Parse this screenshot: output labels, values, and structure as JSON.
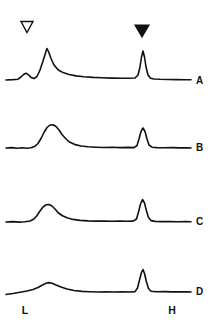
{
  "figure": {
    "background_color": "#ffffff",
    "line_color": "#111111",
    "width": 218,
    "height": 330
  },
  "markers": [
    {
      "name": "open-triangle-marker",
      "style": "open-down-triangle",
      "x": 27,
      "y": 27,
      "annotates": "L",
      "label": ""
    },
    {
      "name": "filled-triangle-marker",
      "style": "filled-down-triangle",
      "x": 142,
      "y": 31,
      "annotates": "H",
      "label": ""
    }
  ],
  "axis": {
    "left_label": "L",
    "left_label_x": 25,
    "left_label_y": 314,
    "right_label": "H",
    "right_label_x": 172,
    "right_label_y": 314
  },
  "traces": [
    {
      "label": "A",
      "label_x": 196,
      "label_y": 84,
      "baseline_y": 80,
      "path": "M 6 80 L 13 79.6 L 18 79.2 L 21 77 L 23.5 74.5 L 26 73.2 L 28.5 74.8 L 31 77.4 L 34 78.6 L 37 76.5 L 40 70 L 43 61 L 45.5 53 L 47 48.5 L 48.5 51.5 L 51 58.5 L 54 65 L 58 69.8 L 63 72.6 L 69 74.5 L 76 75.9 L 84 76.8 L 93 77.4 L 102 77.8 L 112 78.1 L 122 78.3 L 130 78.3 L 135 78 L 138 75 L 140 67 L 141.5 57 L 143 51 L 144.5 57 L 146 67 L 148 75 L 150.5 78.2 L 154 79 L 160 79.3 L 168 79.5 L 176 79.6 L 186 79.7 L 191 79.8"
    },
    {
      "label": "B",
      "label_x": 196,
      "label_y": 151,
      "baseline_y": 148,
      "path": "M 6 148 L 12 147.6 L 17 148.2 L 22 147.7 L 27 148.3 L 31 147.8 L 35 146.2 L 38 143.5 L 41 138.5 L 44 132.5 L 47 127.5 L 50 125 L 53 124.8 L 56 126.5 L 59 130 L 62 134.5 L 66 139 L 70 142.3 L 75 144.6 L 81 146 L 88 146.8 L 96 147.2 L 104 147.5 L 112 147.3 L 120 147.6 L 128 147.4 L 134 147.6 L 137 145.5 L 139 139 L 141 131.5 L 143 128 L 145 131.5 L 147 139 L 149 145 L 152 147.2 L 157 147.6 L 164 147.8 L 172 147.6 L 180 147.9 L 188 147.7 L 191 148"
    },
    {
      "label": "C",
      "label_x": 196,
      "label_y": 225,
      "baseline_y": 222,
      "path": "M 6 222 L 13 221.6 L 19 222.1 L 25 221.7 L 30 221 L 34 219 L 37 215.5 L 40 211 L 43 207 L 46 204.8 L 49 204.5 L 52 206 L 55 209 L 58 212.5 L 62 215.5 L 67 217.8 L 73 219.4 L 80 220.4 L 88 220.9 L 96 221.1 L 104 221 L 112 221.3 L 120 221 L 127 221.3 L 133 221.1 L 136.5 219 L 138.5 212 L 140.5 204 L 142.5 199.5 L 144.5 203 L 146.5 211 L 148.5 217.5 L 151 220.6 L 155 221.4 L 162 221.6 L 170 221.5 L 178 221.7 L 186 221.6 L 191 221.8"
    },
    {
      "label": "D",
      "label_x": 196,
      "label_y": 295,
      "baseline_y": 292,
      "path": "M 6 294.5 L 13 293.5 L 20 292.3 L 27 291 L 33 289.5 L 38 287.5 L 42 285.2 L 46 283.2 L 49 282.6 L 52 283.2 L 56 284.9 L 61 287 L 67 289 L 74 290.5 L 82 291.4 L 90 291.7 L 98 292 L 106 291.7 L 114 292 L 122 291.8 L 130 292 L 135 291.6 L 137.5 288 L 139.5 280 L 141.5 272.5 L 143 269.5 L 144.5 273.5 L 146.5 282 L 148.5 288.5 L 151 291.2 L 156 291.8 L 164 291.6 L 172 291.9 L 180 291.7 L 188 291.9 L 191 292"
    }
  ],
  "chart_data": {
    "type": "line",
    "xlabel": "",
    "ylabel": "",
    "grid": false,
    "legend": "none",
    "x_axis_markers": [
      "L",
      "H"
    ],
    "x_marker_positions": [
      25,
      172
    ],
    "annotations": [
      {
        "symbol": "open down triangle",
        "x": 27,
        "y": 27,
        "refers_to": "L peak"
      },
      {
        "symbol": "filled down triangle",
        "x": 142,
        "y": 31,
        "refers_to": "H peak"
      }
    ],
    "series": [
      {
        "name": "A",
        "baseline_y": 80,
        "peaks": [
          {
            "name": "shoulder",
            "x": 24,
            "height_rel": 0.18
          },
          {
            "name": "L",
            "x": 47,
            "height_rel": 1.0
          },
          {
            "name": "H",
            "x": 143,
            "height_rel": 0.88
          }
        ]
      },
      {
        "name": "B",
        "baseline_y": 148,
        "peaks": [
          {
            "name": "L",
            "x": 51,
            "height_rel": 0.74
          },
          {
            "name": "H",
            "x": 143,
            "height_rel": 0.64
          }
        ]
      },
      {
        "name": "C",
        "baseline_y": 222,
        "peaks": [
          {
            "name": "L",
            "x": 48,
            "height_rel": 0.56
          },
          {
            "name": "H",
            "x": 143,
            "height_rel": 0.72
          }
        ]
      },
      {
        "name": "D",
        "baseline_y": 292,
        "peaks": [
          {
            "name": "L",
            "x": 49,
            "height_rel": 0.31
          },
          {
            "name": "H",
            "x": 143,
            "height_rel": 0.72
          }
        ]
      }
    ]
  }
}
